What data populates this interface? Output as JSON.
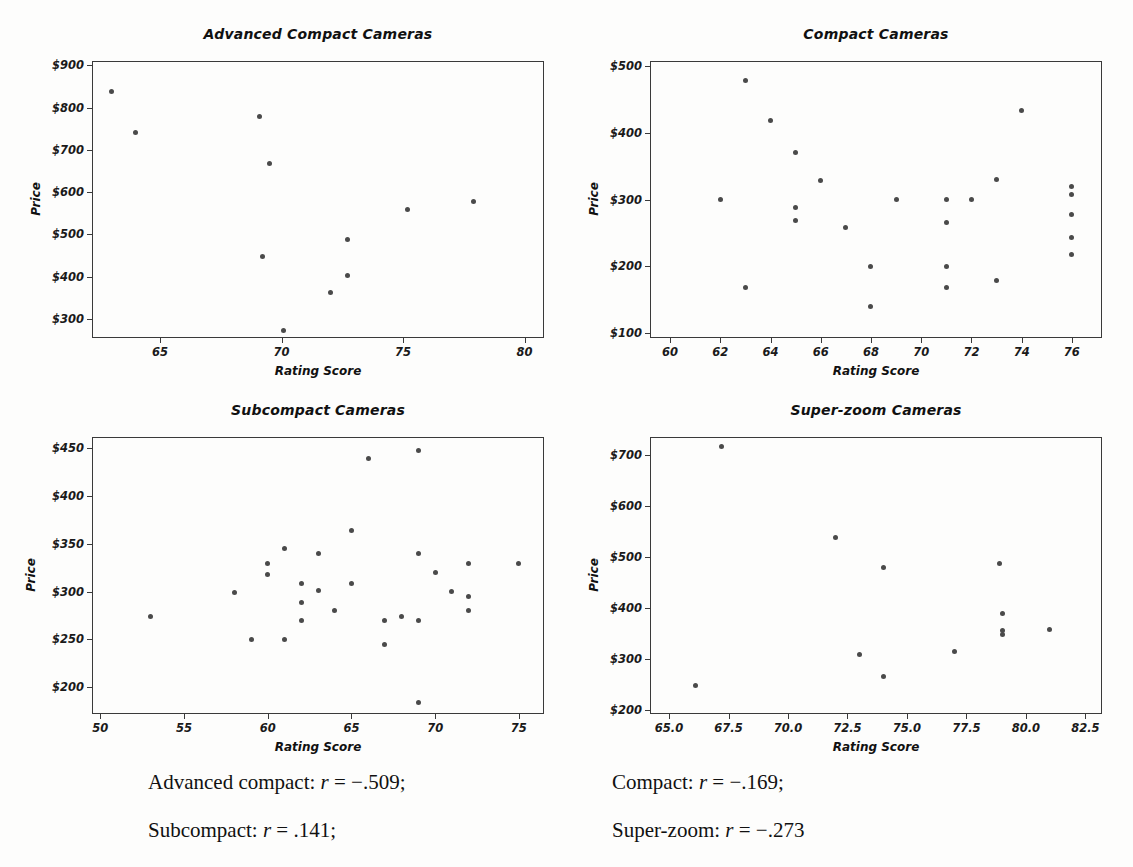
{
  "figure": {
    "axis_titles": {
      "x": "Rating Score",
      "y": "Price"
    }
  },
  "caption": {
    "advanced_compact": "Advanced compact: r = −.509;",
    "compact": "Compact: r = −.169;",
    "subcompact": "Subcompact: r = .141;",
    "superzoom": "Super-zoom: r = −.273"
  },
  "chart_data": [
    {
      "type": "scatter",
      "title": "Advanced Compact Cameras",
      "xlabel": "Rating Score",
      "ylabel": "Price",
      "xlim": [
        62.2,
        80.8
      ],
      "ylim": [
        255,
        910
      ],
      "xticks": [
        65,
        70,
        75,
        80
      ],
      "xticklabels": [
        "65",
        "70",
        "75",
        "80"
      ],
      "yticks": [
        300,
        400,
        500,
        600,
        700,
        800,
        900
      ],
      "yticklabels": [
        "$300",
        "$400",
        "$500",
        "$600",
        "$700",
        "$800",
        "$900"
      ],
      "grid": false,
      "legend": "none",
      "r": -0.509,
      "points": [
        {
          "x": 63.0,
          "y": 838
        },
        {
          "x": 64.0,
          "y": 742
        },
        {
          "x": 69.1,
          "y": 778
        },
        {
          "x": 69.5,
          "y": 668
        },
        {
          "x": 69.2,
          "y": 448
        },
        {
          "x": 70.1,
          "y": 272
        },
        {
          "x": 72.0,
          "y": 362
        },
        {
          "x": 72.7,
          "y": 488
        },
        {
          "x": 72.7,
          "y": 402
        },
        {
          "x": 75.2,
          "y": 558
        },
        {
          "x": 77.9,
          "y": 578
        }
      ]
    },
    {
      "type": "scatter",
      "title": "Compact Cameras",
      "xlabel": "Rating Score",
      "ylabel": "Price",
      "xlim": [
        59.2,
        77.2
      ],
      "ylim": [
        92,
        508
      ],
      "xticks": [
        60,
        62,
        64,
        66,
        68,
        70,
        72,
        74,
        76
      ],
      "xticklabels": [
        "60",
        "62",
        "64",
        "66",
        "68",
        "70",
        "72",
        "74",
        "76"
      ],
      "yticks": [
        100,
        200,
        300,
        400,
        500
      ],
      "yticklabels": [
        "$100",
        "$200",
        "$300",
        "$400",
        "$500"
      ],
      "grid": false,
      "legend": "none",
      "r": -0.169,
      "points": [
        {
          "x": 62.0,
          "y": 300
        },
        {
          "x": 63.0,
          "y": 478
        },
        {
          "x": 63.0,
          "y": 168
        },
        {
          "x": 64.0,
          "y": 418
        },
        {
          "x": 65.0,
          "y": 370
        },
        {
          "x": 65.0,
          "y": 288
        },
        {
          "x": 65.0,
          "y": 268
        },
        {
          "x": 66.0,
          "y": 328
        },
        {
          "x": 67.0,
          "y": 258
        },
        {
          "x": 68.0,
          "y": 200
        },
        {
          "x": 68.0,
          "y": 140
        },
        {
          "x": 69.0,
          "y": 300
        },
        {
          "x": 71.0,
          "y": 300
        },
        {
          "x": 71.0,
          "y": 265
        },
        {
          "x": 71.0,
          "y": 200
        },
        {
          "x": 71.0,
          "y": 168
        },
        {
          "x": 72.0,
          "y": 300
        },
        {
          "x": 73.0,
          "y": 330
        },
        {
          "x": 73.0,
          "y": 178
        },
        {
          "x": 74.0,
          "y": 434
        },
        {
          "x": 76.0,
          "y": 320
        },
        {
          "x": 76.0,
          "y": 308
        },
        {
          "x": 76.0,
          "y": 278
        },
        {
          "x": 76.0,
          "y": 243
        },
        {
          "x": 76.0,
          "y": 218
        }
      ]
    },
    {
      "type": "scatter",
      "title": "Subcompact Cameras",
      "xlabel": "Rating Score",
      "ylabel": "Price",
      "xlim": [
        49.5,
        76.5
      ],
      "ylim": [
        172,
        462
      ],
      "xticks": [
        50,
        55,
        60,
        65,
        70,
        75
      ],
      "xticklabels": [
        "50",
        "55",
        "60",
        "65",
        "70",
        "75"
      ],
      "yticks": [
        200,
        250,
        300,
        350,
        400,
        450
      ],
      "yticklabels": [
        "$200",
        "$250",
        "$300",
        "$350",
        "$400",
        "$450"
      ],
      "grid": false,
      "legend": "none",
      "r": 0.141,
      "points": [
        {
          "x": 53.0,
          "y": 274
        },
        {
          "x": 58.0,
          "y": 299
        },
        {
          "x": 59.0,
          "y": 250
        },
        {
          "x": 60.0,
          "y": 330
        },
        {
          "x": 60.0,
          "y": 318
        },
        {
          "x": 61.0,
          "y": 345
        },
        {
          "x": 61.0,
          "y": 250
        },
        {
          "x": 62.0,
          "y": 309
        },
        {
          "x": 62.0,
          "y": 289
        },
        {
          "x": 62.0,
          "y": 270
        },
        {
          "x": 63.0,
          "y": 340
        },
        {
          "x": 63.0,
          "y": 301
        },
        {
          "x": 64.0,
          "y": 280
        },
        {
          "x": 65.0,
          "y": 364
        },
        {
          "x": 65.0,
          "y": 309
        },
        {
          "x": 66.0,
          "y": 439
        },
        {
          "x": 67.0,
          "y": 270
        },
        {
          "x": 67.0,
          "y": 245
        },
        {
          "x": 68.0,
          "y": 274
        },
        {
          "x": 69.0,
          "y": 448
        },
        {
          "x": 69.0,
          "y": 340
        },
        {
          "x": 69.0,
          "y": 270
        },
        {
          "x": 69.0,
          "y": 184
        },
        {
          "x": 70.0,
          "y": 320
        },
        {
          "x": 71.0,
          "y": 300
        },
        {
          "x": 72.0,
          "y": 330
        },
        {
          "x": 72.0,
          "y": 295
        },
        {
          "x": 72.0,
          "y": 280
        },
        {
          "x": 75.0,
          "y": 330
        }
      ]
    },
    {
      "type": "scatter",
      "title": "Super-zoom Cameras",
      "xlabel": "Rating Score",
      "ylabel": "Price",
      "xlim": [
        64.2,
        83.2
      ],
      "ylim": [
        192,
        735
      ],
      "xticks": [
        65.0,
        67.5,
        70.0,
        72.5,
        75.0,
        77.5,
        80.0,
        82.5
      ],
      "xticklabels": [
        "65.0",
        "67.5",
        "70.0",
        "72.5",
        "75.0",
        "77.5",
        "80.0",
        "82.5"
      ],
      "yticks": [
        200,
        300,
        400,
        500,
        600,
        700
      ],
      "yticklabels": [
        "$200",
        "$300",
        "$400",
        "$500",
        "$600",
        "$700"
      ],
      "grid": false,
      "legend": "none",
      "r": -0.273,
      "points": [
        {
          "x": 66.1,
          "y": 248
        },
        {
          "x": 67.2,
          "y": 716
        },
        {
          "x": 72.0,
          "y": 538
        },
        {
          "x": 73.0,
          "y": 308
        },
        {
          "x": 74.0,
          "y": 480
        },
        {
          "x": 74.0,
          "y": 265
        },
        {
          "x": 77.0,
          "y": 315
        },
        {
          "x": 78.9,
          "y": 488
        },
        {
          "x": 79.0,
          "y": 389
        },
        {
          "x": 79.0,
          "y": 356
        },
        {
          "x": 79.0,
          "y": 348
        },
        {
          "x": 81.0,
          "y": 358
        }
      ]
    }
  ]
}
